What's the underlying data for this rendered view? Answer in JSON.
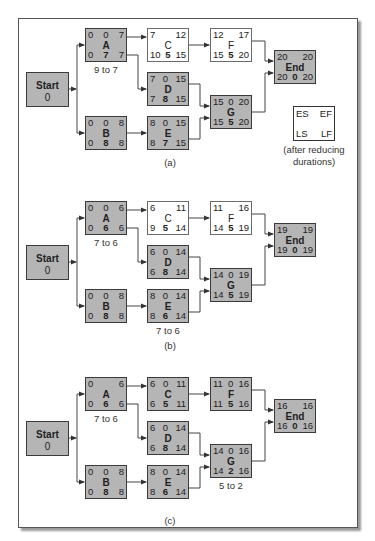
{
  "legend": {
    "es": "ES",
    "ef": "EF",
    "ls": "LS",
    "lf": "LF",
    "caption_line1": "(after reducing",
    "caption_line2": "durations)"
  },
  "panels": [
    {
      "label": "(a)",
      "start": {
        "label": "Start",
        "value": "0"
      },
      "nodes": {
        "A": {
          "name": "A",
          "top": [
            "0",
            "0",
            "7"
          ],
          "bot": [
            "0",
            "7",
            "7"
          ],
          "critical": true,
          "note": "9 to 7"
        },
        "B": {
          "name": "B",
          "top": [
            "0",
            "0",
            "8"
          ],
          "bot": [
            "0",
            "8",
            "8"
          ],
          "critical": true
        },
        "C": {
          "name": "C",
          "top": [
            "7",
            "",
            "12"
          ],
          "bot": [
            "10",
            "5",
            "15"
          ],
          "critical": false
        },
        "D": {
          "name": "D",
          "top": [
            "7",
            "0",
            "15"
          ],
          "bot": [
            "7",
            "8",
            "15"
          ],
          "critical": true
        },
        "E": {
          "name": "E",
          "top": [
            "8",
            "0",
            "15"
          ],
          "bot": [
            "8",
            "7",
            "15"
          ],
          "critical": true
        },
        "F": {
          "name": "F",
          "top": [
            "12",
            "",
            "17"
          ],
          "bot": [
            "15",
            "5",
            "20"
          ],
          "critical": false
        },
        "G": {
          "name": "G",
          "top": [
            "15",
            "0",
            "20"
          ],
          "bot": [
            "15",
            "5",
            "20"
          ],
          "critical": true
        },
        "End": {
          "name": "End",
          "top": [
            "20",
            "",
            "20"
          ],
          "bot": [
            "20",
            "0",
            "20"
          ],
          "critical": true
        }
      }
    },
    {
      "label": "(b)",
      "start": {
        "label": "Start",
        "value": "0"
      },
      "nodes": {
        "A": {
          "name": "A",
          "top": [
            "0",
            "0",
            "6"
          ],
          "bot": [
            "0",
            "6",
            "6"
          ],
          "critical": true,
          "note": "7 to 6"
        },
        "B": {
          "name": "B",
          "top": [
            "0",
            "0",
            "8"
          ],
          "bot": [
            "0",
            "8",
            "8"
          ],
          "critical": true
        },
        "C": {
          "name": "C",
          "top": [
            "6",
            "",
            "11"
          ],
          "bot": [
            "9",
            "5",
            "14"
          ],
          "critical": false
        },
        "D": {
          "name": "D",
          "top": [
            "6",
            "0",
            "14"
          ],
          "bot": [
            "6",
            "8",
            "14"
          ],
          "critical": true
        },
        "E": {
          "name": "E",
          "top": [
            "8",
            "0",
            "14"
          ],
          "bot": [
            "8",
            "6",
            "14"
          ],
          "critical": true,
          "note": "7 to 6"
        },
        "F": {
          "name": "F",
          "top": [
            "11",
            "",
            "16"
          ],
          "bot": [
            "14",
            "5",
            "19"
          ],
          "critical": false
        },
        "G": {
          "name": "G",
          "top": [
            "14",
            "0",
            "19"
          ],
          "bot": [
            "14",
            "5",
            "19"
          ],
          "critical": true
        },
        "End": {
          "name": "End",
          "top": [
            "19",
            "",
            "19"
          ],
          "bot": [
            "19",
            "0",
            "19"
          ],
          "critical": true
        }
      }
    },
    {
      "label": "(c)",
      "start": {
        "label": "Start",
        "value": "0"
      },
      "nodes": {
        "A": {
          "name": "A",
          "top": [
            "0",
            "",
            "6"
          ],
          "bot": [
            "0",
            "6",
            "6"
          ],
          "critical": true,
          "note": "7 to 6"
        },
        "B": {
          "name": "B",
          "top": [
            "0",
            "0",
            "8"
          ],
          "bot": [
            "0",
            "8",
            "8"
          ],
          "critical": true
        },
        "C": {
          "name": "C",
          "top": [
            "6",
            "0",
            "11"
          ],
          "bot": [
            "6",
            "5",
            "11"
          ],
          "critical": true
        },
        "D": {
          "name": "D",
          "top": [
            "6",
            "0",
            "14"
          ],
          "bot": [
            "6",
            "8",
            "14"
          ],
          "critical": true
        },
        "E": {
          "name": "E",
          "top": [
            "8",
            "0",
            "14"
          ],
          "bot": [
            "8",
            "6",
            "14"
          ],
          "critical": true
        },
        "F": {
          "name": "F",
          "top": [
            "11",
            "0",
            "16"
          ],
          "bot": [
            "11",
            "5",
            "16"
          ],
          "critical": true
        },
        "G": {
          "name": "G",
          "top": [
            "14",
            "0",
            "16"
          ],
          "bot": [
            "14",
            "2",
            "16"
          ],
          "critical": true,
          "note": "5 to 2"
        },
        "End": {
          "name": "End",
          "top": [
            "16",
            "",
            "16"
          ],
          "bot": [
            "16",
            "0",
            "16"
          ],
          "critical": true
        }
      }
    }
  ]
}
